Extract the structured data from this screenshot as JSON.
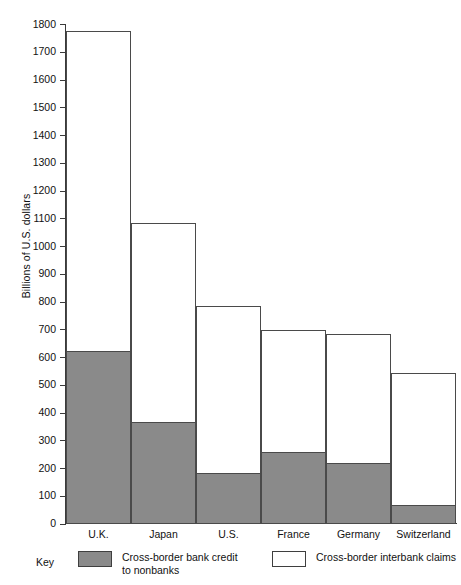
{
  "chart_data": {
    "type": "bar",
    "stacked": true,
    "title": "",
    "xlabel": "",
    "ylabel": "Billions of U.S. dollars",
    "categories": [
      "U.K.",
      "Japan",
      "U.S.",
      "France",
      "Germany",
      "Switzerland"
    ],
    "series": [
      {
        "name": "Cross-border bank credit to nonbanks",
        "color": "#8a8a8a",
        "values": [
          620,
          365,
          180,
          255,
          215,
          65
        ]
      },
      {
        "name": "Cross-border interbank claims",
        "color": "#ffffff",
        "values": [
          1155,
          720,
          605,
          445,
          470,
          480
        ]
      }
    ],
    "totals": [
      1775,
      1085,
      785,
      700,
      685,
      545
    ],
    "ylim": [
      0,
      1800
    ],
    "ytick_step": 100,
    "yticks": [
      0,
      100,
      200,
      300,
      400,
      500,
      600,
      700,
      800,
      900,
      1000,
      1100,
      1200,
      1300,
      1400,
      1500,
      1600,
      1700,
      1800
    ],
    "ytick_labels": [
      "0",
      "100",
      "200",
      "300",
      "400",
      "500",
      "600",
      "700",
      "800",
      "900",
      "1000",
      "1100",
      "1200",
      "1300",
      "1400",
      "1500",
      "1600",
      "1700",
      "1800"
    ],
    "grid": false,
    "legend_position": "bottom"
  },
  "legend": {
    "key_label": "Key",
    "entries": [
      {
        "icon": "filled-square-swatch",
        "line1": "Cross-border bank credit",
        "line2": "to nonbanks"
      },
      {
        "icon": "hollow-square-swatch",
        "line1": "Cross-border interbank claims",
        "line2": ""
      }
    ]
  }
}
